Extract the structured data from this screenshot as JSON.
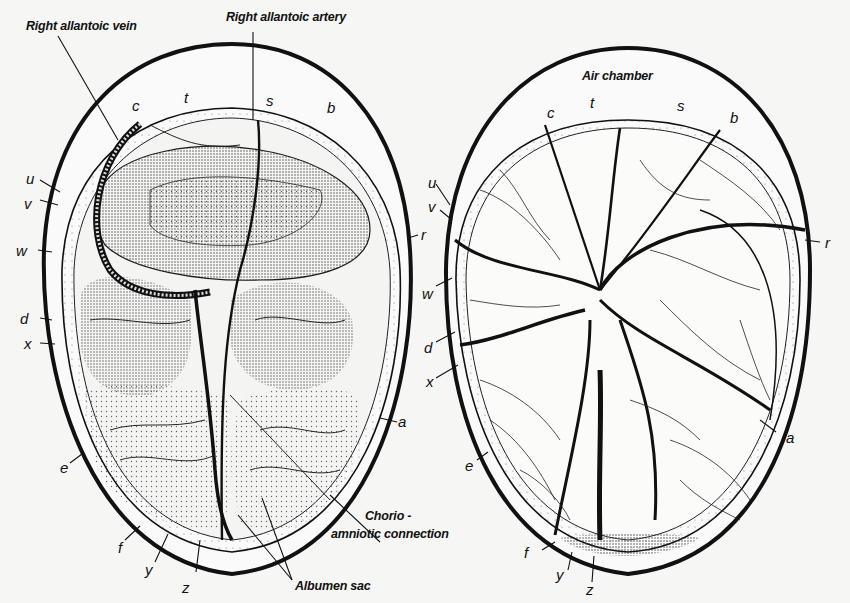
{
  "figure": {
    "left_egg": {
      "title_labels": {
        "right_allantoic_vein": "Right allantoic vein",
        "right_allantoic_artery": "Right allantoic artery",
        "chorio_amniotic_1": "Chorio -",
        "chorio_amniotic_2": "amniotic connection",
        "albumen_sac": "Albumen sac"
      },
      "letters": {
        "c": "c",
        "t": "t",
        "s": "s",
        "b": "b",
        "u": "u",
        "v": "v",
        "w": "w",
        "d": "d",
        "x": "x",
        "r": "r",
        "a": "a",
        "e": "e",
        "f": "f",
        "y": "y",
        "z": "z"
      }
    },
    "right_egg": {
      "title_labels": {
        "air_chamber": "Air chamber"
      },
      "letters": {
        "c": "c",
        "t": "t",
        "s": "s",
        "b": "b",
        "u": "u",
        "v": "v",
        "w": "w",
        "d": "d",
        "x": "x",
        "r": "r",
        "a": "a",
        "e": "e",
        "f": "f",
        "y": "y",
        "z": "z"
      }
    },
    "colors": {
      "ink": "#111111",
      "paper": "#f6f6f4",
      "stipple": "#8a8a8a"
    }
  }
}
